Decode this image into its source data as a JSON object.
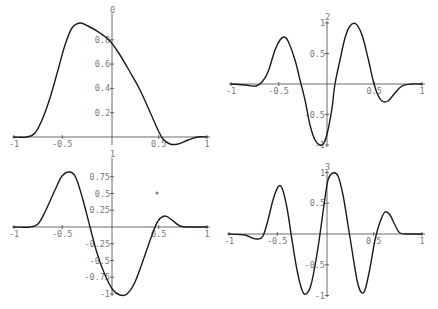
{
  "chart_data": [
    {
      "type": "line",
      "title": "0",
      "xlabel": "",
      "ylabel": "",
      "xlim": [
        -1,
        1
      ],
      "ylim": [
        -0.05,
        1
      ],
      "grid": false,
      "x_ticks": [
        "-1",
        "-0.5",
        "0.5",
        "1"
      ],
      "y_ticks": [
        "0.2",
        "0.4",
        "0.6",
        "0.8"
      ],
      "frame": {
        "x0": 14,
        "x1": 207,
        "xaxis_y": 137,
        "yaxis_x": 112,
        "ypx_per_unit": 121.5
      },
      "x_tick_values": [
        -1,
        -0.5,
        0.5,
        1
      ],
      "y_tick_values": [
        0.2,
        0.4,
        0.6,
        0.8
      ],
      "series": [
        {
          "name": "phi_0",
          "points_px": [
            [
              14,
              137
            ],
            [
              27,
              137
            ],
            [
              35,
              133
            ],
            [
              42,
              120
            ],
            [
              50,
              98
            ],
            [
              58,
              70
            ],
            [
              65,
              45
            ],
            [
              72,
              28
            ],
            [
              80,
              23
            ],
            [
              88,
              26
            ],
            [
              100,
              33
            ],
            [
              110,
              41
            ],
            [
              120,
              55
            ],
            [
              130,
              72
            ],
            [
              140,
              90
            ],
            [
              150,
              112
            ],
            [
              158,
              130
            ],
            [
              163,
              139
            ],
            [
              170,
              144
            ],
            [
              178,
              144
            ],
            [
              188,
              140
            ],
            [
              198,
              137
            ],
            [
              207,
              137
            ]
          ]
        }
      ]
    },
    {
      "type": "line",
      "title": "2",
      "xlabel": "",
      "ylabel": "",
      "xlim": [
        -1,
        1
      ],
      "ylim": [
        -1,
        1
      ],
      "grid": false,
      "x_ticks": [
        "-1",
        "-0.5",
        "0.5",
        "1"
      ],
      "y_ticks": [
        "1",
        "0.5",
        "-0.5",
        "-1"
      ],
      "frame": {
        "x0": 231,
        "x1": 422,
        "xaxis_y": 84,
        "yaxis_x": 327,
        "ypx_per_unit": 61
      },
      "x_tick_values": [
        -1,
        -0.5,
        0.5,
        1
      ],
      "y_tick_values": [
        1,
        0.5,
        -0.5,
        -1
      ],
      "series": [
        {
          "name": "psi_2",
          "points_px": [
            [
              231,
              84
            ],
            [
              245,
              85
            ],
            [
              256,
              86
            ],
            [
              262,
              82
            ],
            [
              268,
              72
            ],
            [
              275,
              50
            ],
            [
              280,
              40
            ],
            [
              284,
              37
            ],
            [
              288,
              41
            ],
            [
              295,
              60
            ],
            [
              300,
              80
            ],
            [
              305,
              100
            ],
            [
              310,
              125
            ],
            [
              315,
              140
            ],
            [
              320,
              145
            ],
            [
              324,
              143
            ],
            [
              328,
              130
            ],
            [
              332,
              108
            ],
            [
              335,
              84
            ],
            [
              340,
              60
            ],
            [
              345,
              38
            ],
            [
              350,
              26
            ],
            [
              356,
              24
            ],
            [
              362,
              35
            ],
            [
              368,
              58
            ],
            [
              373,
              80
            ],
            [
              377,
              93
            ],
            [
              382,
              101
            ],
            [
              388,
              101
            ],
            [
              395,
              93
            ],
            [
              402,
              86
            ],
            [
              412,
              84
            ],
            [
              422,
              84
            ]
          ]
        }
      ]
    },
    {
      "type": "line",
      "title": "1",
      "xlabel": "",
      "ylabel": "",
      "xlim": [
        -1,
        1
      ],
      "ylim": [
        -1,
        1
      ],
      "grid": false,
      "x_ticks": [
        "-1",
        "-0.5",
        "0.5",
        "1"
      ],
      "y_ticks": [
        "0.75",
        "0.5",
        "0.25",
        "-0.25",
        "-0.5",
        "-0.75",
        "-1"
      ],
      "frame": {
        "x0": 14,
        "x1": 207,
        "xaxis_y": 227,
        "yaxis_x": 112,
        "ypx_per_unit": 67
      },
      "x_tick_values": [
        -1,
        -0.5,
        0.5,
        1
      ],
      "y_tick_values": [
        0.75,
        0.5,
        0.25,
        -0.25,
        -0.5,
        -0.75,
        -1
      ],
      "series": [
        {
          "name": "psi_1",
          "points_px": [
            [
              14,
              227
            ],
            [
              30,
              227
            ],
            [
              38,
              224
            ],
            [
              45,
              212
            ],
            [
              55,
              190
            ],
            [
              62,
              176
            ],
            [
              70,
              172
            ],
            [
              76,
              178
            ],
            [
              83,
              200
            ],
            [
              90,
              227
            ],
            [
              97,
              253
            ],
            [
              105,
              275
            ],
            [
              113,
              290
            ],
            [
              120,
              295
            ],
            [
              127,
              294
            ],
            [
              135,
              282
            ],
            [
              145,
              255
            ],
            [
              152,
              235
            ],
            [
              158,
              221
            ],
            [
              165,
              216
            ],
            [
              172,
              220
            ],
            [
              180,
              226
            ],
            [
              190,
              227
            ],
            [
              207,
              227
            ]
          ]
        }
      ]
    },
    {
      "type": "line",
      "title": "3",
      "xlabel": "",
      "ylabel": "",
      "xlim": [
        -1,
        1
      ],
      "ylim": [
        -1,
        1
      ],
      "grid": false,
      "x_ticks": [
        "-1",
        "-0.5",
        "0.5",
        "1"
      ],
      "y_ticks": [
        "1",
        "0.5",
        "-0.5",
        "-1"
      ],
      "frame": {
        "x0": 229,
        "x1": 422,
        "xaxis_y": 234,
        "yaxis_x": 327,
        "ypx_per_unit": 61.5
      },
      "x_tick_values": [
        -1,
        -0.5,
        0.5,
        1
      ],
      "y_tick_values": [
        1,
        0.5,
        -0.5,
        -1
      ],
      "series": [
        {
          "name": "psi_3",
          "points_px": [
            [
              229,
              234
            ],
            [
              245,
              235
            ],
            [
              252,
              238
            ],
            [
              258,
              239
            ],
            [
              263,
              236
            ],
            [
              268,
              220
            ],
            [
              273,
              200
            ],
            [
              278,
              187
            ],
            [
              282,
              188
            ],
            [
              287,
              208
            ],
            [
              292,
              240
            ],
            [
              297,
              270
            ],
            [
              302,
              290
            ],
            [
              306,
              294
            ],
            [
              311,
              285
            ],
            [
              316,
              260
            ],
            [
              320,
              234
            ],
            [
              324,
              205
            ],
            [
              328,
              180
            ],
            [
              333,
              173
            ],
            [
              338,
              176
            ],
            [
              343,
              195
            ],
            [
              348,
              225
            ],
            [
              352,
              250
            ],
            [
              357,
              280
            ],
            [
              361,
              292
            ],
            [
              365,
              290
            ],
            [
              370,
              268
            ],
            [
              375,
              240
            ],
            [
              380,
              222
            ],
            [
              385,
              212
            ],
            [
              390,
              215
            ],
            [
              395,
              225
            ],
            [
              400,
              233
            ],
            [
              410,
              234
            ],
            [
              422,
              234
            ]
          ]
        }
      ]
    }
  ],
  "annotations": [
    {
      "type": "marker",
      "x_px": 157,
      "y_px": 193
    }
  ]
}
